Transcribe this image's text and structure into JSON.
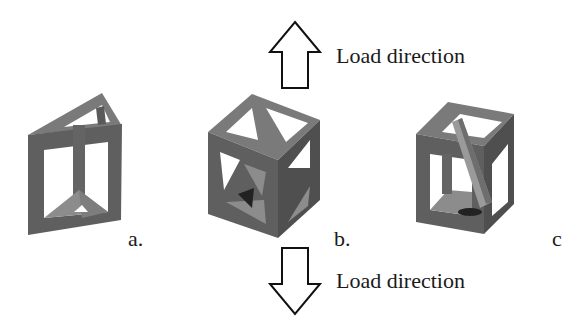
{
  "figure": {
    "load_top": {
      "label": "Load direction",
      "direction": "up"
    },
    "load_bottom": {
      "label": "Load direction",
      "direction": "down"
    },
    "panels": [
      {
        "id": "a",
        "label": "a.",
        "shape": "triangular prism lattice cell"
      },
      {
        "id": "b",
        "label": "b.",
        "shape": "cubic cell with diagonal face bracing"
      },
      {
        "id": "c",
        "label": "c",
        "shape": "cubic cell with internal diagonal strut"
      }
    ],
    "colors": {
      "strut_front": "#5f5f5f",
      "strut_top": "#7a7a7a",
      "strut_side": "#4d4d4d",
      "inner": "#8c8c8c",
      "arrow_stroke": "#111111",
      "background": "#ffffff"
    }
  }
}
